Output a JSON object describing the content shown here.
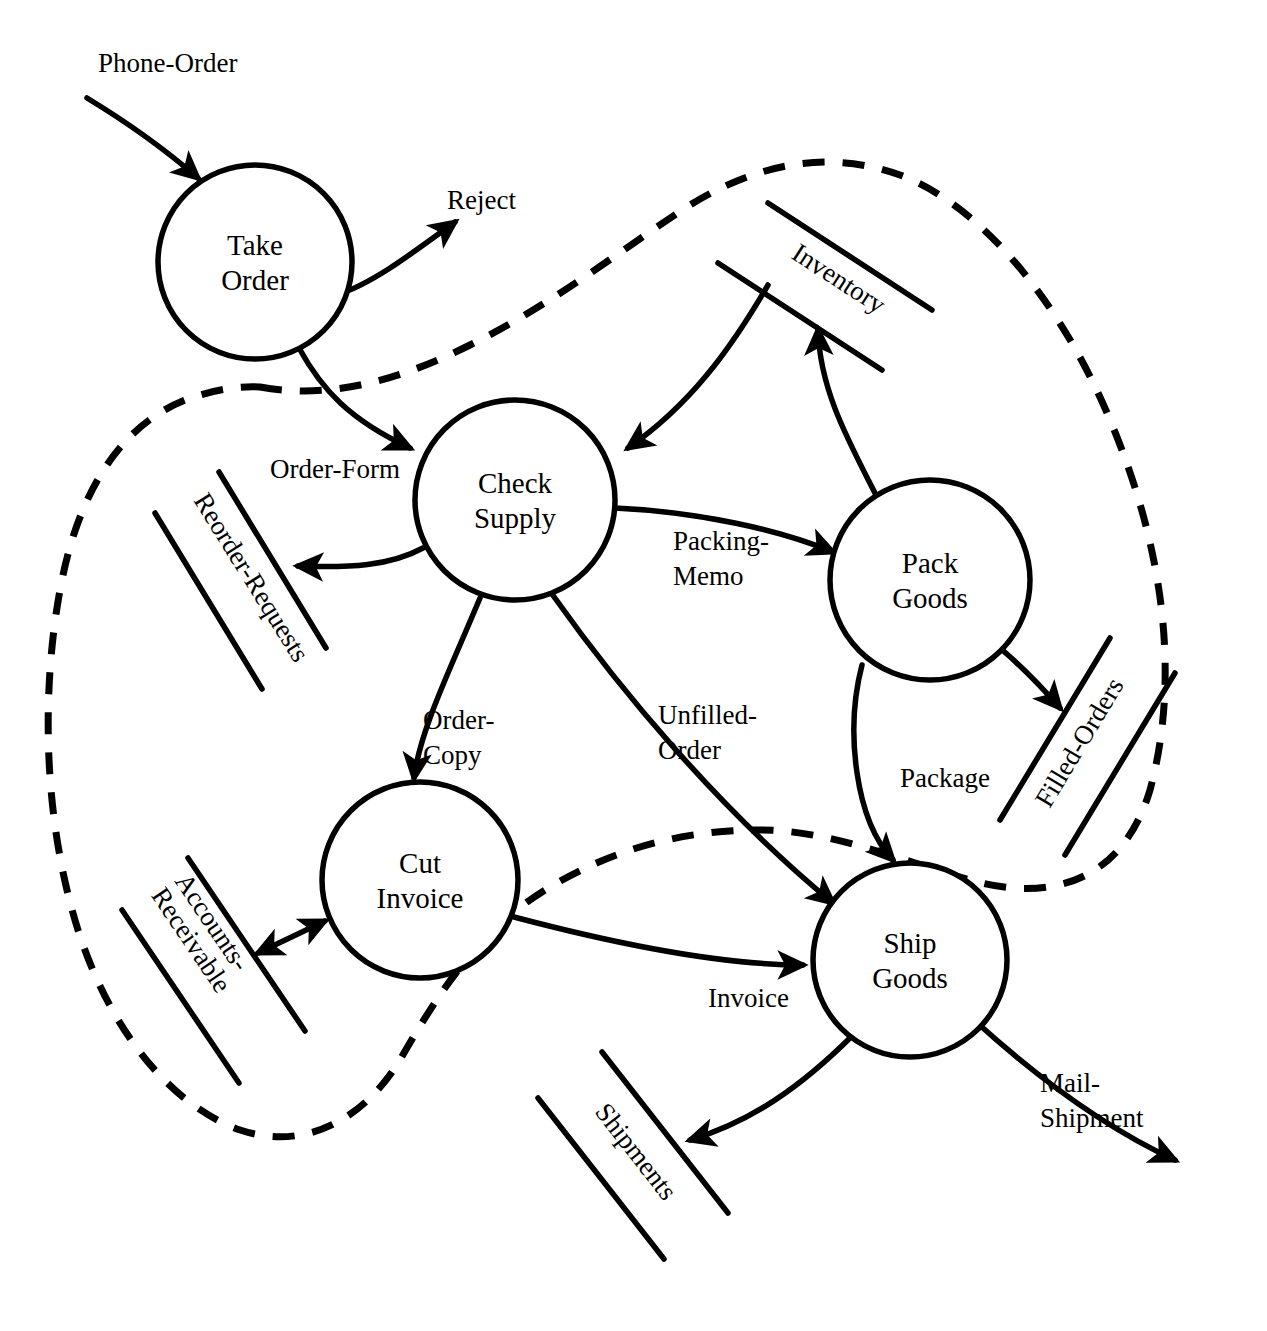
{
  "diagram": {
    "type": "data-flow-diagram",
    "title": "",
    "processes": [
      {
        "id": "take-order",
        "label_line1": "Take",
        "label_line2": "Order",
        "cx": 255,
        "cy": 262,
        "r": 97
      },
      {
        "id": "check-supply",
        "label_line1": "Check",
        "label_line2": "Supply",
        "cx": 515,
        "cy": 500,
        "r": 100
      },
      {
        "id": "pack-goods",
        "label_line1": "Pack",
        "label_line2": "Goods",
        "cx": 930,
        "cy": 580,
        "r": 100
      },
      {
        "id": "cut-invoice",
        "label_line1": "Cut",
        "label_line2": "Invoice",
        "cx": 420,
        "cy": 880,
        "r": 98
      },
      {
        "id": "ship-goods",
        "label_line1": "Ship",
        "label_line2": "Goods",
        "cx": 910,
        "cy": 960,
        "r": 97
      }
    ],
    "data_stores": [
      {
        "id": "inventory",
        "label": "Inventory"
      },
      {
        "id": "reorder-requests",
        "label": "Reorder-Requests"
      },
      {
        "id": "filled-orders",
        "label": "Filled-Orders"
      },
      {
        "id": "accounts-receivable",
        "label_line1": "Accounts-",
        "label_line2": "Receivable",
        "label": "Accounts-Receivable"
      },
      {
        "id": "shipments",
        "label": "Shipments"
      }
    ],
    "data_flows": [
      {
        "id": "phone-order",
        "label": "Phone-Order",
        "from": "external",
        "to": "take-order"
      },
      {
        "id": "reject",
        "label": "Reject",
        "from": "take-order",
        "to": "external"
      },
      {
        "id": "order-form",
        "label": "Order-Form",
        "from": "take-order",
        "to": "check-supply"
      },
      {
        "id": "reorder",
        "label": "",
        "from": "check-supply",
        "to": "reorder-requests"
      },
      {
        "id": "inventory-read",
        "label": "",
        "from": "inventory",
        "to": "check-supply"
      },
      {
        "id": "packing-memo",
        "label_line1": "Packing-",
        "label_line2": "Memo",
        "label": "Packing-Memo",
        "from": "check-supply",
        "to": "pack-goods"
      },
      {
        "id": "inventory-write",
        "label": "",
        "from": "pack-goods",
        "to": "inventory"
      },
      {
        "id": "order-copy",
        "label_line1": "Order-",
        "label_line2": "Copy",
        "label": "Order-Copy",
        "from": "check-supply",
        "to": "cut-invoice"
      },
      {
        "id": "unfilled-order",
        "label_line1": "Unfilled-",
        "label_line2": "Order",
        "label": "Unfilled-Order",
        "from": "check-supply",
        "to": "ship-goods"
      },
      {
        "id": "filled",
        "label": "",
        "from": "pack-goods",
        "to": "filled-orders"
      },
      {
        "id": "package",
        "label": "Package",
        "from": "pack-goods",
        "to": "ship-goods"
      },
      {
        "id": "accounts-rw",
        "label": "",
        "from": "cut-invoice",
        "to": "accounts-receivable",
        "bidirectional": true
      },
      {
        "id": "invoice",
        "label": "Invoice",
        "from": "cut-invoice",
        "to": "ship-goods"
      },
      {
        "id": "shipments-out",
        "label": "",
        "from": "ship-goods",
        "to": "shipments"
      },
      {
        "id": "mail-shipment",
        "label_line1": "Mail-",
        "label_line2": "Shipment",
        "label": "Mail-Shipment",
        "from": "ship-goods",
        "to": "external"
      }
    ],
    "boundary": {
      "id": "system-boundary",
      "style": "dashed",
      "label": ""
    },
    "colors": {
      "ink": "#000000",
      "paper": "#ffffff"
    }
  }
}
